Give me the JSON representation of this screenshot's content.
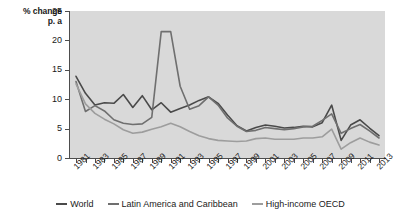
{
  "chart_data": {
    "type": "line",
    "title": "",
    "subtitle": "",
    "xlabel": "",
    "ylabel": "% change\np. a",
    "ylabel_line1": "% change",
    "ylabel_line2": "p. a",
    "ylim": [
      0,
      25
    ],
    "yticks": [
      0,
      5,
      10,
      15,
      20,
      25
    ],
    "ytick_labels": [
      "0",
      "5",
      "10",
      "15",
      "20",
      "25"
    ],
    "grid": false,
    "legend_position": "bottom",
    "x": [
      1981,
      1982,
      1983,
      1984,
      1985,
      1986,
      1987,
      1988,
      1989,
      1990,
      1991,
      1992,
      1993,
      1994,
      1995,
      1996,
      1997,
      1998,
      1999,
      2000,
      2001,
      2002,
      2003,
      2004,
      2005,
      2006,
      2007,
      2008,
      2009,
      2010,
      2011,
      2012,
      2013
    ],
    "xtick_labels": [
      "1981",
      "1983",
      "1985",
      "1987",
      "1989",
      "1991",
      "1993",
      "1995",
      "1997",
      "1999",
      "2001",
      "2003",
      "2005",
      "2007",
      "2009",
      "2011",
      "2013"
    ],
    "xtick_values": [
      1981,
      1983,
      1985,
      1987,
      1989,
      1991,
      1993,
      1995,
      1997,
      1999,
      2001,
      2003,
      2005,
      2007,
      2009,
      2011,
      2013
    ],
    "series": [
      {
        "name": "World",
        "color": "#4a4a4a",
        "values": [
          13.9,
          11.0,
          9.0,
          9.4,
          9.3,
          10.8,
          8.6,
          10.6,
          8.2,
          9.4,
          7.8,
          8.4,
          9.0,
          9.8,
          10.4,
          9.3,
          7.3,
          5.5,
          4.6,
          5.2,
          5.6,
          5.4,
          5.1,
          5.2,
          5.4,
          5.3,
          6.0,
          9.0,
          3.0,
          5.6,
          6.5,
          5.1,
          3.8
        ]
      },
      {
        "name": "Latin America and Caribbean",
        "color": "#6f6f6f",
        "values": [
          13.0,
          7.9,
          8.9,
          8.0,
          6.5,
          5.9,
          5.7,
          5.8,
          6.9,
          21.5,
          21.5,
          12.2,
          8.3,
          8.9,
          10.4,
          9.0,
          6.8,
          5.4,
          4.5,
          4.7,
          5.2,
          5.0,
          4.8,
          5.0,
          5.3,
          5.4,
          6.4,
          7.5,
          4.2,
          5.0,
          5.7,
          4.6,
          3.4
        ]
      },
      {
        "name": "High-income OECD",
        "color": "#9d9d9d",
        "values": [
          12.6,
          9.2,
          7.6,
          6.6,
          5.8,
          4.8,
          4.2,
          4.4,
          4.9,
          5.3,
          5.9,
          5.3,
          4.5,
          3.8,
          3.3,
          3.0,
          2.9,
          2.8,
          2.9,
          3.3,
          3.4,
          3.2,
          3.2,
          3.2,
          3.4,
          3.4,
          3.6,
          4.9,
          1.5,
          2.6,
          3.4,
          2.7,
          2.2
        ]
      }
    ]
  },
  "legend": {
    "items": [
      {
        "label": "World",
        "color": "#4a4a4a"
      },
      {
        "label": "Latin America and Caribbean",
        "color": "#6f6f6f"
      },
      {
        "label": "High-income OECD",
        "color": "#9d9d9d"
      }
    ]
  },
  "colors": {
    "plot_background": "#d9d9d9",
    "axis": "#4d4d4d",
    "text": "#1a1a1a"
  }
}
